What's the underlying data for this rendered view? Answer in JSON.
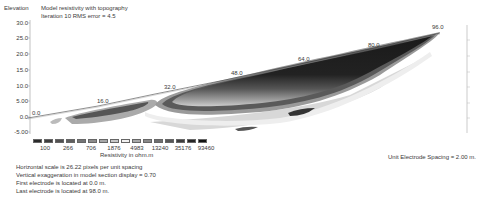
{
  "chart_data": {
    "type": "heatmap",
    "title": "Model resistivity with topography",
    "subtitle": "Iteration 10 RMS error = 4.5",
    "ylabel": "Elevation",
    "y_ticks": [
      "30.0",
      "25.0",
      "20.0",
      "15.0",
      "10.0",
      "5.00",
      "0.0",
      "-5.00"
    ],
    "ylim": [
      -5.0,
      30.0
    ],
    "x_electrode_labels": [
      "0.0",
      "16.0",
      "32.0",
      "48.0",
      "64.0",
      "80.0",
      "96.0"
    ],
    "xlim": [
      0.0,
      98.0
    ],
    "legend": {
      "title": "Resistivity in ohm.m",
      "values": [
        "100",
        "266",
        "706",
        "1876",
        "4983",
        "13240",
        "35176",
        "93460"
      ],
      "colors": [
        "#2a2a2a",
        "#3d3d3d",
        "#505050",
        "#5f5f5f",
        "#757575",
        "#8c8c8c",
        "#a8a8a8",
        "#c8c8c8",
        "#f2f2f2",
        "#a8a8a8",
        "#8a8a8a",
        "#6f6f6f",
        "#565656",
        "#3d3d3d",
        "#262626",
        "#111111"
      ]
    },
    "topography": [
      [
        0,
        0.0
      ],
      [
        16,
        5.0
      ],
      [
        32,
        10.5
      ],
      [
        48,
        15.0
      ],
      [
        64,
        19.5
      ],
      [
        80,
        23.5
      ],
      [
        96,
        28.5
      ]
    ],
    "notes": [
      "Horizontal scale is 26.22 pixels per unit spacing",
      "Vertical exaggeration in model section display = 0.70",
      "First electrode is located at 0.0 m.",
      "Last electrode is located at 98.0 m."
    ],
    "unit_spacing": "Unit Electrode Spacing = 2.00 m."
  }
}
